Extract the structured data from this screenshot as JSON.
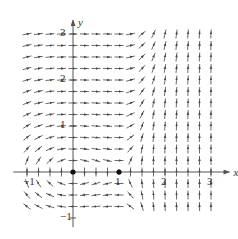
{
  "figure": {
    "type": "direction_field",
    "width": 238,
    "height": 239,
    "origin_px": [
      73,
      172
    ],
    "scale_px_per_unit": 46,
    "arrow_length_px": 9,
    "grid": {
      "x_start": -1.0,
      "x_end": 3.0,
      "x_step": 0.25,
      "y_start": -0.75,
      "y_end": 3.0,
      "y_step": 0.25
    },
    "colors": {
      "axis": "#555555",
      "arrow": "#444444",
      "equilibrium": "#111111",
      "text": "#333333"
    },
    "axes": {
      "x_label": "x",
      "y_label": "y",
      "x_ticks": [
        {
          "value": -1,
          "label": "−1"
        },
        {
          "value": 1,
          "label": "1"
        },
        {
          "value": 2,
          "label": "2"
        },
        {
          "value": 3,
          "label": "3"
        }
      ],
      "y_ticks": [
        {
          "value": -1,
          "label": "−1"
        },
        {
          "value": 1,
          "label": "1"
        },
        {
          "value": 2,
          "label": "2"
        },
        {
          "value": 3,
          "label": "3"
        }
      ],
      "x_range": [
        -1.3,
        3.4
      ],
      "y_range": [
        -1.2,
        3.3
      ]
    },
    "equilibria": [
      {
        "x": 0,
        "y": 0,
        "label": "center"
      },
      {
        "x": 1,
        "y": 0,
        "label": "saddle"
      }
    ]
  },
  "chart_data": {
    "type": "direction_field",
    "title": "",
    "xlabel": "x",
    "ylabel": "y",
    "xlim": [
      -1.3,
      3.4
    ],
    "ylim": [
      -1.2,
      3.3
    ],
    "grid": false,
    "x_ticks": [
      -1,
      1,
      2,
      3
    ],
    "y_ticks": [
      -1,
      1,
      2,
      3
    ],
    "equilibrium_points": [
      [
        0,
        0
      ],
      [
        1,
        0
      ]
    ],
    "field_description": "Counterclockwise rotation around (0,0); saddle at (1,0); nearly horizontal rightward arrows for y>1 and x<1.2; arrows turn sharply vertical (upward) for x>1.5",
    "field_model": "dx/dt = y, dy/dt = x(x-1)(0.3 + 6*max(0, x-1)) (approximate, normalized)"
  }
}
